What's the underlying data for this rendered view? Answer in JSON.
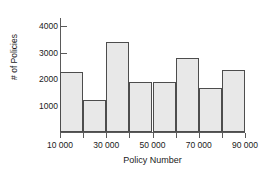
{
  "chart_data": {
    "type": "bar",
    "title": "",
    "xlabel": "Policy Number",
    "ylabel": "# of Policies",
    "categories": [
      "10000-20000",
      "20000-30000",
      "30000-40000",
      "40000-50000",
      "50000-60000",
      "60000-70000",
      "70000-80000",
      "80000-90000"
    ],
    "bin_edges": [
      10000,
      20000,
      30000,
      40000,
      50000,
      60000,
      70000,
      80000,
      90000
    ],
    "values": [
      2250,
      1200,
      3400,
      1880,
      1900,
      2800,
      1650,
      2350
    ],
    "xlim": [
      10000,
      90000
    ],
    "ylim": [
      0,
      4300
    ],
    "yticks": [
      1000,
      2000,
      3000,
      4000
    ],
    "ytick_labels": [
      "1000",
      "2000",
      "3000",
      "4000"
    ],
    "xticks": [
      10000,
      20000,
      30000,
      40000,
      50000,
      60000,
      70000,
      80000,
      90000
    ],
    "xtick_labels": [
      "10 000",
      "",
      "30 000",
      "",
      "50 000",
      "",
      "70 000",
      "",
      "90 000"
    ],
    "grid": false,
    "legend": "none",
    "bar_fill_color": "#e8e8e8",
    "bar_edge_color": "#4d4d4d",
    "axis_color": "#5a5a5a",
    "background_color": "#ffffff"
  }
}
